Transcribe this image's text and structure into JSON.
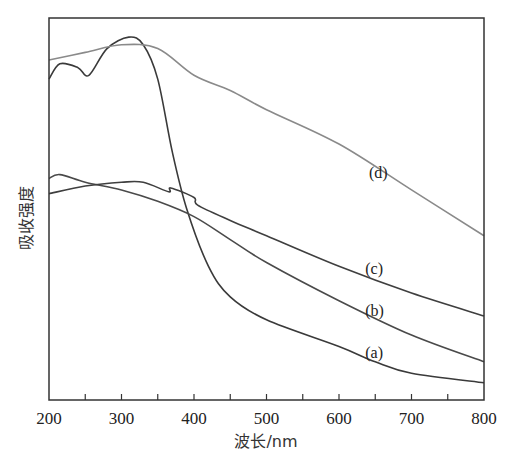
{
  "chart_data": {
    "type": "line",
    "title": "",
    "xlabel": "波长/nm",
    "ylabel": "吸收强度",
    "xlim": [
      200,
      800
    ],
    "ylim": [
      0,
      1
    ],
    "x_ticks": [
      200,
      300,
      400,
      500,
      600,
      700,
      800
    ],
    "x_minor_ticks": [
      250,
      350,
      450,
      550,
      650,
      750
    ],
    "y_ticks": [],
    "grid": false,
    "legend": "inline labels",
    "series": [
      {
        "name": "(a)",
        "color": "#3a3a3a",
        "label_pos": [
          650,
          0.11
        ],
        "x": [
          200,
          215,
          240,
          255,
          280,
          310,
          330,
          350,
          370,
          390,
          420,
          450,
          500,
          600,
          650,
          700,
          800
        ],
        "values": [
          0.84,
          0.88,
          0.87,
          0.85,
          0.92,
          0.95,
          0.93,
          0.84,
          0.65,
          0.5,
          0.35,
          0.27,
          0.21,
          0.14,
          0.1,
          0.07,
          0.045
        ]
      },
      {
        "name": "(b)",
        "color": "#4a4a4a",
        "label_pos": [
          650,
          0.22
        ],
        "x": [
          200,
          215,
          250,
          300,
          350,
          400,
          450,
          500,
          600,
          700,
          800
        ],
        "values": [
          0.58,
          0.59,
          0.57,
          0.55,
          0.52,
          0.48,
          0.42,
          0.36,
          0.26,
          0.17,
          0.1
        ]
      },
      {
        "name": "(c)",
        "color": "#3f3f3f",
        "label_pos": [
          650,
          0.33
        ],
        "x": [
          200,
          250,
          300,
          330,
          365,
          368,
          400,
          405,
          450,
          500,
          600,
          700,
          800
        ],
        "values": [
          0.54,
          0.56,
          0.57,
          0.57,
          0.545,
          0.555,
          0.53,
          0.51,
          0.47,
          0.43,
          0.35,
          0.28,
          0.22
        ]
      },
      {
        "name": "(d)",
        "color": "#8a8a8a",
        "label_pos": [
          655,
          0.58
        ],
        "x": [
          200,
          250,
          300,
          350,
          400,
          450,
          500,
          600,
          700,
          800
        ],
        "values": [
          0.89,
          0.91,
          0.93,
          0.92,
          0.85,
          0.81,
          0.76,
          0.67,
          0.55,
          0.43
        ]
      }
    ]
  },
  "labels": {
    "xlabel": "波长/nm",
    "ylabel": "吸收强度"
  }
}
